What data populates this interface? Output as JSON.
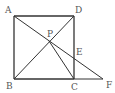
{
  "diagram": {
    "type": "geometry",
    "points": {
      "A": {
        "label": "A",
        "x": 14,
        "y": 16
      },
      "B": {
        "label": "B",
        "x": 14,
        "y": 79
      },
      "C": {
        "label": "C",
        "x": 74,
        "y": 79
      },
      "D": {
        "label": "D",
        "x": 74,
        "y": 16
      },
      "P": {
        "label": "P",
        "x": 49,
        "y": 41
      },
      "E": {
        "label": "E",
        "x": 74,
        "y": 56
      },
      "F": {
        "label": "F",
        "x": 103,
        "y": 79
      }
    },
    "segments": [
      [
        "A",
        "B"
      ],
      [
        "B",
        "C"
      ],
      [
        "C",
        "D"
      ],
      [
        "D",
        "A"
      ],
      [
        "B",
        "D"
      ],
      [
        "A",
        "F"
      ],
      [
        "P",
        "C"
      ],
      [
        "C",
        "F"
      ]
    ],
    "labels": {
      "A": "A",
      "B": "B",
      "C": "C",
      "D": "D",
      "P": "P",
      "E": "E",
      "F": "F"
    },
    "colors": {
      "line": "#333333",
      "label": "#555555",
      "background": "#ffffff"
    }
  }
}
